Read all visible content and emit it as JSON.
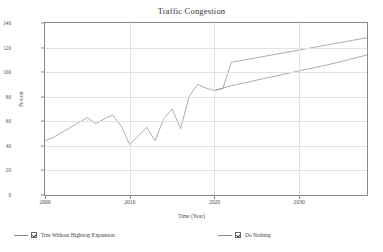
{
  "chart": {
    "title": "Traffic Congestion",
    "xlabel": "Time (Year)",
    "ylabel": "Percent"
  },
  "legend": {
    "items": [
      {
        "label": "Trns Without Highway Expansion",
        "check": "checkbox-checked"
      },
      {
        "label": "Do Nothing",
        "check": "checkbox-checked"
      }
    ]
  },
  "chart_data": {
    "type": "line",
    "title": "Traffic Congestion",
    "xlabel": "Time (Year)",
    "ylabel": "Percent",
    "xlim": [
      2000,
      2038
    ],
    "ylim": [
      0,
      140
    ],
    "xticks": [
      2000,
      2010,
      2020,
      2030
    ],
    "yticks": [
      0,
      20,
      40,
      60,
      80,
      100,
      120,
      140
    ],
    "grid": "horizontal-and-vertical-light",
    "legend_position": "bottom",
    "series": [
      {
        "name": "Trns Without Highway Expansion",
        "color": "#8a8a8a",
        "x": [
          2000,
          2001,
          2002,
          2003,
          2004,
          2005,
          2006,
          2007,
          2008,
          2009,
          2010,
          2011,
          2012,
          2013,
          2014,
          2015,
          2016,
          2017,
          2018,
          2019,
          2020,
          2021,
          2022,
          2026,
          2030,
          2034,
          2038
        ],
        "y": [
          44,
          47,
          51,
          55,
          59,
          63,
          58,
          62,
          65,
          56,
          41,
          48,
          55,
          44,
          62,
          70,
          54,
          80,
          90,
          87,
          85,
          87,
          108,
          113,
          118,
          123,
          128
        ]
      },
      {
        "name": "Do Nothing",
        "color": "#8a8a8a",
        "x": [
          2020,
          2022,
          2026,
          2030,
          2034,
          2038
        ],
        "y": [
          85,
          89,
          95,
          101,
          107,
          114
        ]
      }
    ]
  }
}
